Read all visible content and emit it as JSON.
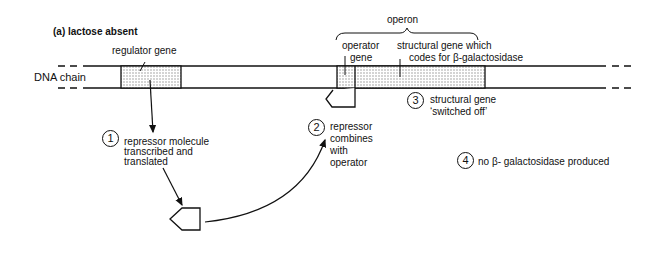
{
  "title": "(a)   lactose absent",
  "labels": {
    "dna_chain": "DNA chain",
    "regulator_gene": "regulator gene",
    "operon": "operon",
    "operator_gene_line1": "operator",
    "operator_gene_line2": "gene",
    "structural_gene_line1": "structural gene which",
    "structural_gene_line2": "codes for β-galactosidase"
  },
  "steps": [
    {
      "number": "1",
      "lines": [
        "repressor molecule",
        "transcribed and",
        "translated"
      ]
    },
    {
      "number": "2",
      "lines": [
        "repressor",
        "combines",
        "with",
        "operator"
      ]
    },
    {
      "number": "3",
      "lines": [
        "structural gene",
        "‘switched off’"
      ]
    },
    {
      "number": "4",
      "lines": [
        "no β- galactosidase produced"
      ]
    }
  ],
  "colors": {
    "line": "#111111",
    "stipple": "#cccccc",
    "background": "#ffffff"
  }
}
